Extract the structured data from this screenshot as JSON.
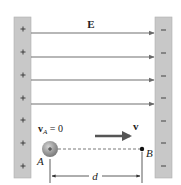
{
  "diagram": {
    "field_label": "E",
    "velocity_label": "v",
    "initial_velocity_label": {
      "symbol": "v",
      "subscript": "A",
      "rest": " = 0"
    },
    "point_a_label": "A",
    "point_b_label": "B",
    "distance_label": "d",
    "particle_charge": "+",
    "left_plate": {
      "sign": "+",
      "charges": [
        "+",
        "+",
        "+",
        "+",
        "+",
        "+",
        "+"
      ]
    },
    "right_plate": {
      "sign": "−",
      "charges": [
        "−",
        "−",
        "−",
        "−",
        "−",
        "−",
        "−"
      ]
    },
    "field_line_count": 4,
    "colors": {
      "plate": "#c8c8c8",
      "plate_edge": "#a9a9a9",
      "field_line": "#707070",
      "particle": "#9a9a9a",
      "text": "#222222"
    }
  }
}
